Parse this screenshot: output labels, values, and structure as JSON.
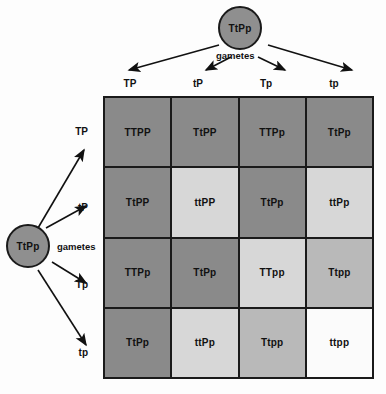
{
  "diagram": {
    "parents": {
      "top": {
        "genotype": "TtPp",
        "gametes_label": "gametes"
      },
      "left": {
        "genotype": "TtPp",
        "gametes_label": "gametes"
      }
    },
    "column_gametes": [
      "TP",
      "tP",
      "Tp",
      "tp"
    ],
    "row_gametes": [
      "TP",
      "tP",
      "Tp",
      "tp"
    ],
    "colors": {
      "dark": "#8a8a8a",
      "medium": "#b9b9b9",
      "light": "#d7d7d7",
      "white": "#fbfbfb",
      "stroke": "#1a1a1a",
      "circle_fill": "#8f8f8f"
    },
    "cells": [
      [
        {
          "genotype": "TTPP",
          "shade": "dark"
        },
        {
          "genotype": "TtPP",
          "shade": "dark"
        },
        {
          "genotype": "TTPp",
          "shade": "dark"
        },
        {
          "genotype": "TtPp",
          "shade": "dark"
        }
      ],
      [
        {
          "genotype": "TtPP",
          "shade": "dark"
        },
        {
          "genotype": "ttPP",
          "shade": "light"
        },
        {
          "genotype": "TtPp",
          "shade": "dark"
        },
        {
          "genotype": "ttPp",
          "shade": "light"
        }
      ],
      [
        {
          "genotype": "TTPp",
          "shade": "dark"
        },
        {
          "genotype": "TtPp",
          "shade": "dark"
        },
        {
          "genotype": "TTpp",
          "shade": "light"
        },
        {
          "genotype": "Ttpp",
          "shade": "medium"
        }
      ],
      [
        {
          "genotype": "TtPp",
          "shade": "dark"
        },
        {
          "genotype": "ttPp",
          "shade": "light"
        },
        {
          "genotype": "Ttpp",
          "shade": "medium"
        },
        {
          "genotype": "ttpp",
          "shade": "white"
        }
      ]
    ]
  }
}
